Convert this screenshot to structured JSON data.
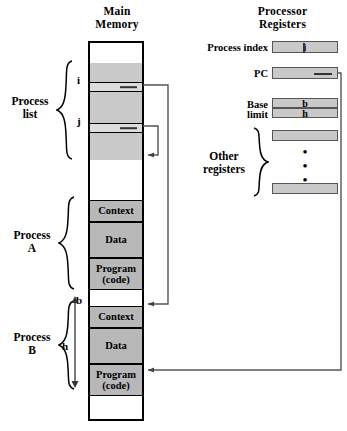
{
  "diagram": {
    "title_main_memory": "Main\nMemory",
    "title_processor_registers": "Processor\nRegisters"
  },
  "headings": {
    "main_memory_line1": "Main",
    "main_memory_line2": "Memory",
    "processor_registers_line1": "Processor",
    "processor_registers_line2": "Registers"
  },
  "memory": {
    "row_marker_i": "i",
    "row_marker_j": "j",
    "row_marker_b": "b",
    "span_marker_h": "h",
    "process_a": {
      "context": "Context",
      "data": "Data",
      "program_line1": "Program",
      "program_line2": "(code)"
    },
    "process_b": {
      "context": "Context",
      "data": "Data",
      "program_line1": "Program",
      "program_line2": "(code)"
    }
  },
  "braces": {
    "process_list_line1": "Process",
    "process_list_line2": "list",
    "process_a_line1": "Process",
    "process_a_line2": "A",
    "process_b_line1": "Process",
    "process_b_line2": "B",
    "other_registers_line1": "Other",
    "other_registers_line2": "registers"
  },
  "registers": [
    {
      "label": "Process index",
      "value": "i"
    },
    {
      "label": "PC",
      "value": ""
    },
    {
      "label": "Base",
      "value": "b"
    },
    {
      "label": "limit",
      "value": "h"
    }
  ],
  "register_labels": {
    "process_index": "Process index",
    "pc": "PC",
    "base": "Base",
    "limit": "limit"
  },
  "register_values": {
    "process_index": "i",
    "pc": "",
    "base": "b",
    "limit": "h",
    "other_top": "",
    "other_bottom": ""
  },
  "vertical_dots": "•\n•\n•",
  "colors": {
    "fill_gray": "#c9c9c9",
    "fill_gray_light": "#dcdcdc",
    "fill_gray_seg": "#b8b8b8",
    "line": "#000000",
    "connector": "#555555"
  }
}
